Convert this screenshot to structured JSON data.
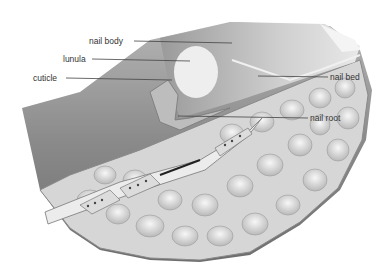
{
  "diagram": {
    "labels": [
      {
        "id": "nail-body",
        "text": "nail body",
        "x": 89,
        "y": 36
      },
      {
        "id": "lunula",
        "text": "lunula",
        "x": 63,
        "y": 54
      },
      {
        "id": "cuticle",
        "text": "cuticle",
        "x": 33,
        "y": 73
      },
      {
        "id": "nail-bed",
        "text": "nail bed",
        "x": 330,
        "y": 72
      },
      {
        "id": "nail-root",
        "text": "nail root",
        "x": 310,
        "y": 113
      }
    ],
    "colors": {
      "skin_dark": "#7a7a7a",
      "skin_mid": "#a8a8a8",
      "nail": "#c8c8c8",
      "lunula": "#efefef",
      "fat": "#dcdcdc",
      "bone": "#e6e6e6",
      "leader_line": "#444444",
      "text": "#333333"
    }
  }
}
